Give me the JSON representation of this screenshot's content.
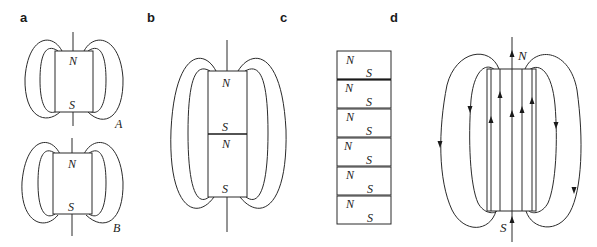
{
  "panels": {
    "a": {
      "label": "a",
      "magnets": [
        {
          "north": "N",
          "south": "S",
          "tag": "A"
        },
        {
          "north": "N",
          "south": "S",
          "tag": "B"
        }
      ]
    },
    "b": {
      "label": "b",
      "segments": [
        {
          "north": "N",
          "south": "S"
        },
        {
          "north": "N",
          "south": "S"
        }
      ]
    },
    "c": {
      "label": "c",
      "domains": [
        {
          "north": "N",
          "south": "S"
        },
        {
          "north": "N",
          "south": "S"
        },
        {
          "north": "N",
          "south": "S"
        },
        {
          "north": "N",
          "south": "S"
        },
        {
          "north": "N",
          "south": "S"
        },
        {
          "north": "N",
          "south": "S"
        }
      ]
    },
    "d": {
      "label": "d",
      "north": "N",
      "south": "S"
    }
  },
  "colors": {
    "line": "#2a2a2a",
    "background": "#ffffff"
  }
}
